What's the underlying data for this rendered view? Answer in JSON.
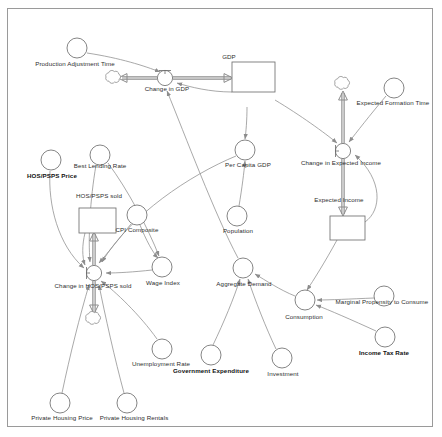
{
  "diagram": {
    "type": "stock-and-flow",
    "colors": {
      "frame_border": "#9a9a9a",
      "link": "#8c8c8c",
      "flow": "#8c8c8c",
      "node_stroke": "#6f6f6f",
      "text": "#2e2e2e",
      "text_bold": "#111111",
      "background": "#ffffff"
    },
    "stocks": [
      {
        "id": "gdp",
        "label": "GDP",
        "x": 232,
        "y": 77,
        "w": 43,
        "h": 30,
        "label_x": 229,
        "label_y": 57
      },
      {
        "id": "hos_sold",
        "label": "HOS/PSPS sold",
        "x": 79,
        "y": 208,
        "w": 37,
        "h": 25,
        "label_x": 99,
        "label_y": 196
      },
      {
        "id": "expected_income",
        "label": "Expected Income",
        "x": 330,
        "y": 216,
        "w": 35,
        "h": 24,
        "label_x": 339,
        "label_y": 200
      }
    ],
    "flows": [
      {
        "id": "change_in_gdp",
        "label": "Change in GDP",
        "x": 165,
        "y": 78,
        "label_x": 167,
        "label_y": 89
      },
      {
        "id": "change_in_hos_sold",
        "label": "Change in HOS/PSPS sold",
        "x": 94,
        "y": 273,
        "label_x": 93,
        "label_y": 286
      },
      {
        "id": "change_in_expected_income",
        "label": "Change in Expected Income",
        "x": 343,
        "y": 151,
        "label_x": 341,
        "label_y": 163
      }
    ],
    "clouds": [
      {
        "id": "cloud-gdp-source",
        "x": 112,
        "y": 79
      },
      {
        "id": "cloud-hos-sink",
        "x": 94,
        "y": 320
      },
      {
        "id": "cloud-expected-income-source",
        "x": 343,
        "y": 85
      }
    ],
    "variables": [
      {
        "id": "production_adjustment_time",
        "label": "Production Adjustment Time",
        "x": 77,
        "y": 48,
        "r": 10,
        "label_x": 75,
        "label_y": 64,
        "bold": false
      },
      {
        "id": "per_capita_gdp",
        "label": "Per Capita GDP",
        "x": 245,
        "y": 150,
        "r": 10,
        "label_x": 248,
        "label_y": 165,
        "bold": false
      },
      {
        "id": "population",
        "label": "Population",
        "x": 237,
        "y": 216,
        "r": 10,
        "label_x": 238,
        "label_y": 231,
        "bold": false
      },
      {
        "id": "expected_formation_time",
        "label": "Expected Formation Time",
        "x": 394,
        "y": 88,
        "r": 10,
        "label_x": 393,
        "label_y": 103,
        "bold": false
      },
      {
        "id": "hos_price",
        "label": "HOS/PSPS Price",
        "x": 51,
        "y": 160,
        "r": 10,
        "label_x": 52,
        "label_y": 176,
        "bold": true
      },
      {
        "id": "best_lending_rate",
        "label": "Best Lending Rate",
        "x": 100,
        "y": 155,
        "r": 10,
        "label_x": 100,
        "label_y": 166,
        "bold": false
      },
      {
        "id": "cpi_composite",
        "label": "CPI Composite",
        "x": 137,
        "y": 215,
        "r": 10,
        "label_x": 137,
        "label_y": 230,
        "bold": false
      },
      {
        "id": "wage_index",
        "label": "Wage Index",
        "x": 162,
        "y": 267,
        "r": 10,
        "label_x": 163,
        "label_y": 283,
        "bold": false
      },
      {
        "id": "aggregate_demand",
        "label": "Aggregate Demand",
        "x": 243,
        "y": 268,
        "r": 10,
        "label_x": 244,
        "label_y": 284,
        "bold": false
      },
      {
        "id": "consumption",
        "label": "Consumption",
        "x": 305,
        "y": 300,
        "r": 10,
        "label_x": 304,
        "label_y": 317,
        "bold": false
      },
      {
        "id": "marginal_propensity_to_consume",
        "label": "Marginal Propensity to Consume",
        "x": 384,
        "y": 296,
        "r": 10,
        "label_x": 382,
        "label_y": 302,
        "bold": false
      },
      {
        "id": "income_tax_rate",
        "label": "Income Tax Rate",
        "x": 385,
        "y": 337,
        "r": 10,
        "label_x": 384,
        "label_y": 353,
        "bold": true
      },
      {
        "id": "unemployment_rate",
        "label": "Unemployment Rate",
        "x": 162,
        "y": 349,
        "r": 10,
        "label_x": 161,
        "label_y": 364,
        "bold": false
      },
      {
        "id": "government_expenditure",
        "label": "Government Expenditure",
        "x": 211,
        "y": 355,
        "r": 10,
        "label_x": 211,
        "label_y": 371,
        "bold": true
      },
      {
        "id": "investment",
        "label": "Investment",
        "x": 282,
        "y": 358,
        "r": 10,
        "label_x": 283,
        "label_y": 374,
        "bold": false
      },
      {
        "id": "private_housing_price",
        "label": "Private Housing Price",
        "x": 60,
        "y": 403,
        "r": 10,
        "label_x": 62,
        "label_y": 418,
        "bold": false
      },
      {
        "id": "private_housing_rentals",
        "label": "Private Housing Rentals",
        "x": 127,
        "y": 403,
        "r": 10,
        "label_x": 134,
        "label_y": 418,
        "bold": false
      }
    ],
    "links": [
      {
        "from": "production_adjustment_time",
        "to": "change_in_gdp"
      },
      {
        "from": "gdp",
        "to": "change_in_gdp"
      },
      {
        "from": "gdp",
        "to": "per_capita_gdp"
      },
      {
        "from": "population",
        "to": "per_capita_gdp"
      },
      {
        "from": "gdp",
        "to": "change_in_expected_income"
      },
      {
        "from": "expected_formation_time",
        "to": "change_in_expected_income"
      },
      {
        "from": "expected_income",
        "to": "change_in_expected_income"
      },
      {
        "from": "expected_income",
        "to": "consumption"
      },
      {
        "from": "marginal_propensity_to_consume",
        "to": "consumption"
      },
      {
        "from": "income_tax_rate",
        "to": "consumption"
      },
      {
        "from": "consumption",
        "to": "aggregate_demand"
      },
      {
        "from": "government_expenditure",
        "to": "aggregate_demand"
      },
      {
        "from": "investment",
        "to": "aggregate_demand"
      },
      {
        "from": "aggregate_demand",
        "to": "change_in_gdp"
      },
      {
        "from": "per_capita_gdp",
        "to": "change_in_hos_sold"
      },
      {
        "from": "hos_price",
        "to": "change_in_hos_sold"
      },
      {
        "from": "best_lending_rate",
        "to": "change_in_hos_sold"
      },
      {
        "from": "cpi_composite",
        "to": "change_in_hos_sold"
      },
      {
        "from": "wage_index",
        "to": "change_in_hos_sold"
      },
      {
        "from": "unemployment_rate",
        "to": "change_in_hos_sold"
      },
      {
        "from": "private_housing_price",
        "to": "change_in_hos_sold"
      },
      {
        "from": "private_housing_rentals",
        "to": "change_in_hos_sold"
      },
      {
        "from": "cpi_composite",
        "to": "wage_index"
      },
      {
        "from": "best_lending_rate",
        "to": "wage_index"
      },
      {
        "from": "hos_sold",
        "to": "change_in_hos_sold"
      }
    ]
  }
}
